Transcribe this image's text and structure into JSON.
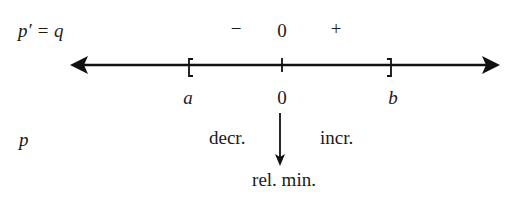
{
  "diagram": {
    "type": "sign-chart",
    "rows": {
      "derivative_row": {
        "label": "p′ = q",
        "signs": [
          {
            "text": "−",
            "region": "left-of-zero"
          },
          {
            "text": "0",
            "region": "at-zero"
          },
          {
            "text": "+",
            "region": "right-of-zero"
          }
        ]
      },
      "function_row": {
        "label": "p",
        "left_behavior": "decr.",
        "right_behavior": "incr.",
        "extremum": "rel. min."
      }
    },
    "number_line": {
      "left_endpoint": "[",
      "right_endpoint": "]",
      "points": [
        {
          "label": "a",
          "italic": true
        },
        {
          "label": "0",
          "italic": false
        },
        {
          "label": "b",
          "italic": true
        }
      ]
    },
    "colors": {
      "ink": "#111111",
      "background": "#ffffff"
    }
  }
}
